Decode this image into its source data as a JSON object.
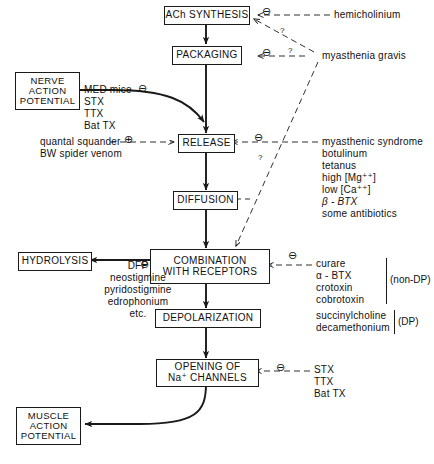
{
  "diagram": {
    "nodes": {
      "ach_synthesis": "ACh SYNTHESIS",
      "packaging": "PACKAGING",
      "release": "RELEASE",
      "diffusion": "DIFFUSION",
      "combination_line1": "COMBINATION",
      "combination_line2": "WITH  RECEPTORS",
      "depolarization": "DEPOLARIZATION",
      "opening_line1": "OPENING OF",
      "opening_line2": "Na⁺ CHANNELS",
      "hydrolysis": "HYDROLYSIS",
      "nerve_ap_line1": "NERVE",
      "nerve_ap_line2": "ACTION",
      "nerve_ap_line3": "POTENTIAL",
      "muscle_ap_line1": "MUSCLE",
      "muscle_ap_line2": "ACTION",
      "muscle_ap_line3": "POTENTIAL"
    },
    "labels": {
      "hemicholinium": "hemicholinium",
      "myasthenia_gravis": "myasthenia gravis",
      "quantal_squander": "quantal squander",
      "bw_spider_venom": "BW spider venom",
      "non_dp": "(non-DP)",
      "dp": "(DP)",
      "question": "?"
    },
    "lists": {
      "nerve_ap_blockers": [
        "MED mice",
        "STX",
        "TTX",
        "Bat TX"
      ],
      "release_inhibitors": [
        "myasthenic syndrome",
        "botulinum",
        "tetanus",
        "high [Mg⁺⁺]",
        "low  [Ca⁺⁺]",
        "β - BTX",
        "some antibiotics"
      ],
      "hydrolysis_inhibitors": [
        "DFP",
        "neostigmine",
        "pyridostigmine",
        "edrophonium",
        "etc."
      ],
      "receptor_blockers_nondp": [
        "curare",
        "α - BTX",
        "crotoxin",
        "cobrotoxin"
      ],
      "receptor_blockers_dp": [
        "succinylcholine",
        "decamethonium"
      ],
      "na_channel_blockers": [
        "STX",
        "TTX",
        "Bat TX"
      ]
    },
    "symbols": {
      "inhibit": "⊖",
      "excite": "⊕"
    },
    "colors": {
      "ink": "#1a1a1a",
      "paper": "#ffffff"
    }
  }
}
